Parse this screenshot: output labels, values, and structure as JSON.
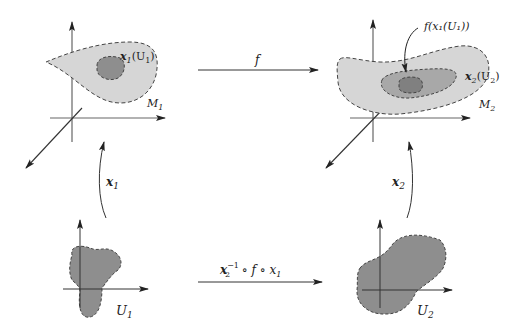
{
  "diagram": {
    "type": "commutative diagram of manifold charts",
    "top_left": {
      "manifold_label": "M",
      "manifold_subscript": "1",
      "region_label_main": "x",
      "region_label_sub": "1",
      "region_label_arg": "(U",
      "region_label_arg_sub": "1",
      "region_label_close": ")"
    },
    "top_right": {
      "manifold_label": "M",
      "manifold_subscript": "2",
      "region_label_main": "x",
      "region_label_sub": "2",
      "region_label_arg": "(U",
      "region_label_arg_sub": "2",
      "region_label_close": ")",
      "image_label": "f(x₁(U₁))"
    },
    "bottom_left": {
      "label": "U",
      "subscript": "1"
    },
    "bottom_right": {
      "label": "U",
      "subscript": "2"
    },
    "arrows": {
      "top": "f",
      "bottom_main": "x",
      "bottom_sub": "2",
      "bottom_sup": "−1",
      "bottom_rest": " ∘ f ∘ x",
      "bottom_rest_sub": "1",
      "left": "x",
      "left_sub": "1",
      "right": "x",
      "right_sub": "2"
    },
    "colors": {
      "light_fill": "#d6d6d6",
      "mid_fill": "#a8a8a8",
      "dark_fill": "#8a8a8a",
      "chart_fill": "#8e8e8e",
      "outline": "#444444",
      "axis": "#666666"
    }
  }
}
